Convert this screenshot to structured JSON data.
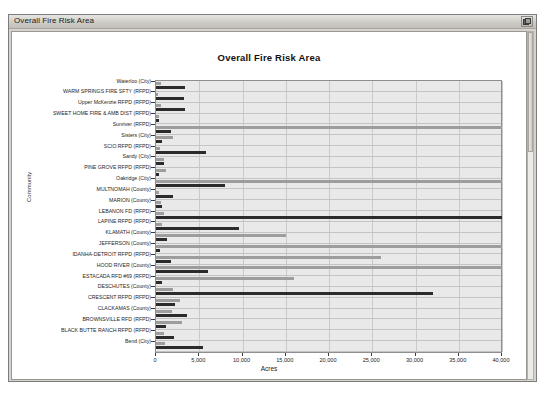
{
  "window": {
    "title": "Overall Fire Risk Area",
    "titlebar_button_icon": "restore-icon"
  },
  "chart_data": {
    "type": "bar",
    "orientation": "horizontal",
    "title": "Overall Fire Risk Area",
    "xlabel": "Acres",
    "ylabel": "Community",
    "footnote": "Includes 1000-ft buffer",
    "xlim": [
      0,
      40000
    ],
    "xticks": [
      0,
      5000,
      10000,
      15000,
      20000,
      25000,
      30000,
      35000,
      40000
    ],
    "xtick_labels": [
      "0",
      "5,000",
      "10,000",
      "15,000",
      "20,000",
      "25,000",
      "30,000",
      "35,000",
      "40,000"
    ],
    "grid": "vertical",
    "legend": "none",
    "colors": {
      "dark": "#2b2b2b",
      "light": "#9d9d9d",
      "plot_background": "#e9e9e9"
    },
    "categories": [
      "Waterloo (City)",
      "WARM SPRINGS FIRE SFTY (RFPD)",
      "Upper McKenzie RFPD (RFPD)",
      "SWEET HOME FIRE & AMB DIST (RFPD)",
      "Sunriver (RFPD)",
      "Sisters (City)",
      "SCIO RFPD (RFPD)",
      "Sandy (City)",
      "PINE GROVE RFPD (RFPD)",
      "Oakridge (City)",
      "MULTNOMAH (County)",
      "MARION (County)",
      "LEBANON FD (RFPD)",
      "LAPINE RFPD (RFPD)",
      "KLAMATH (County)",
      "JEFFERSON (County)",
      "IDANHA-DETROIT RFPD (RFPD)",
      "HOOD RIVER (County)",
      "ESTACADA RFD #69 (RFPD)",
      "DESCHUTES (County)",
      "CRESCENT RFPD (RFPD)",
      "CLACKAMAS (County)",
      "BROWNSVILLE RFD (RFPD)",
      "BLACK BUTTE RANCH RFPD (RFPD)",
      "Bend (City)"
    ],
    "series": [
      {
        "name": "upper",
        "color": "#9d9d9d",
        "values": [
          600,
          200,
          600,
          300,
          45000,
          2000,
          500,
          900,
          1100,
          45000,
          400,
          600,
          900,
          700,
          15000,
          45000,
          26000,
          45000,
          16000,
          2000,
          2800,
          1800,
          3000,
          900,
          1000
        ]
      },
      {
        "name": "lower",
        "color": "#2b2b2b",
        "values": [
          3400,
          3200,
          3300,
          400,
          1700,
          700,
          5800,
          900,
          300,
          8000,
          2000,
          700,
          45000,
          9600,
          1300,
          500,
          1700,
          6000,
          700,
          32000,
          2200,
          3600,
          1100,
          2100,
          5400
        ]
      }
    ]
  }
}
